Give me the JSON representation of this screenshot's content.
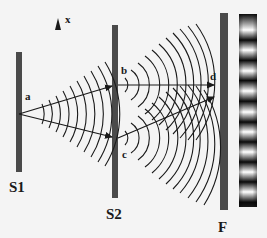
{
  "diagram": {
    "colors": {
      "background": "#f4f4f4",
      "barrier": "#4a4a4a",
      "line": "#1a1a1a",
      "fringe_dark": "#0a0a0a",
      "fringe_bright": "#ffffff"
    },
    "axis": {
      "arrow_label": "x"
    },
    "barriers": [
      {
        "id": "S1",
        "label": "S1"
      },
      {
        "id": "S2",
        "label": "S2"
      },
      {
        "id": "F",
        "label": "F"
      }
    ],
    "points": {
      "a": "a",
      "b": "b",
      "c": "c",
      "d": "d"
    },
    "fringe_pattern": {
      "bright_band_count": 9,
      "dark_band_count": 10
    }
  }
}
